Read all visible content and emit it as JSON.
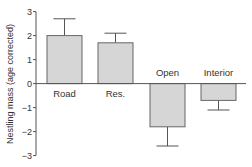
{
  "chart_data": {
    "type": "bar",
    "title": "",
    "xlabel": "",
    "ylabel": "Nestling mass (age corrected)",
    "categories": [
      "Road",
      "Res.",
      "Open",
      "Interior"
    ],
    "values": [
      2.0,
      1.7,
      -1.8,
      -0.7
    ],
    "error_bars": [
      0.7,
      0.4,
      0.8,
      0.4
    ],
    "ylim": [
      -3,
      3
    ],
    "yticks": [
      3,
      2,
      1,
      0,
      -1,
      -2,
      -3
    ],
    "grid": false,
    "legend": null,
    "bar_color": "#d6d6d6",
    "edge_color": "#666666"
  }
}
